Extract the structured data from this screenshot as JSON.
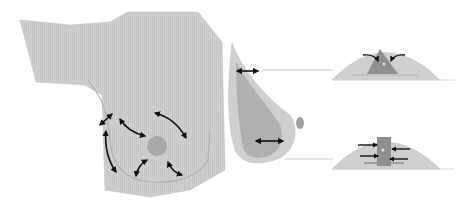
{
  "diagram": {
    "type": "medical-illustration",
    "panels": [
      {
        "id": "frontal-view",
        "description": "Frontal view of torso with nipple-areola and curved double-headed arrows showing dissection directions"
      },
      {
        "id": "lateral-view",
        "description": "Lateral profile of breast with horizontal double-headed arrows indicating tissue thickness"
      },
      {
        "id": "cross-section-top",
        "description": "Cross-section with triangular defect and curved arrows pulling tissue inward"
      },
      {
        "id": "cross-section-bottom",
        "description": "Cross-section with rectangular column and straight arrows converging from both sides"
      }
    ],
    "colors": {
      "background": "#ffffff",
      "skin": "#cfcfcf",
      "skin_edge": "#bdbdbd",
      "inner_tissue": "#b5b5b5",
      "gland": "#8f8f8f",
      "areola": "#9e9e9e",
      "arrow": "#111111",
      "guide_line": "#c8c8c8"
    }
  }
}
